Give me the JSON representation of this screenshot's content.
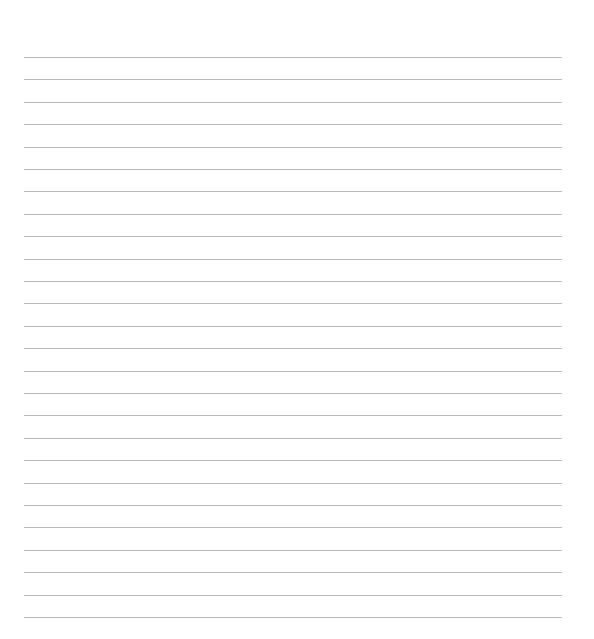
{
  "document": {
    "type": "lined-paper",
    "line_color": "#b9b9b9",
    "background_color": "#ffffff",
    "line_count": 26,
    "lines": [
      "",
      "",
      "",
      "",
      "",
      "",
      "",
      "",
      "",
      "",
      "",
      "",
      "",
      "",
      "",
      "",
      "",
      "",
      "",
      "",
      "",
      "",
      "",
      "",
      "",
      ""
    ]
  }
}
